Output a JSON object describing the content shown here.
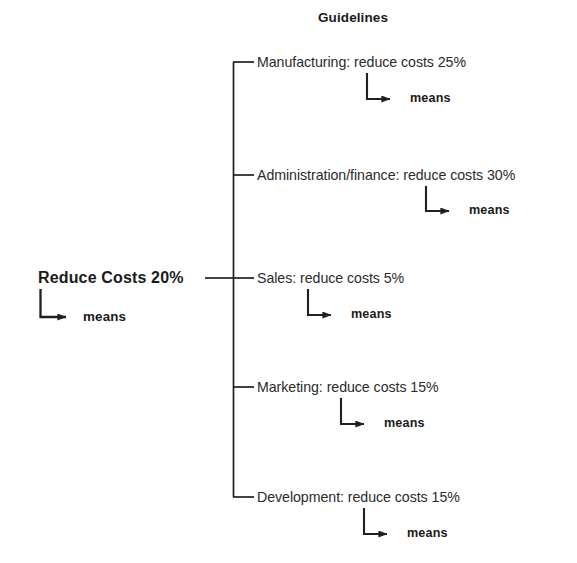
{
  "diagram": {
    "type": "tree",
    "title": "Guidelines",
    "root": {
      "label": "Reduce Costs 20%",
      "means_label": "means"
    },
    "branches": [
      {
        "label": "Manufacturing: reduce costs 25%",
        "means_label": "means",
        "department": "Manufacturing",
        "reduction_percent": 25
      },
      {
        "label": "Administration/finance: reduce costs 30%",
        "means_label": "means",
        "department": "Administration/finance",
        "reduction_percent": 30
      },
      {
        "label": "Sales: reduce costs 5%",
        "means_label": "means",
        "department": "Sales",
        "reduction_percent": 5
      },
      {
        "label": "Marketing: reduce costs 15%",
        "means_label": "means",
        "department": "Marketing",
        "reduction_percent": 15
      },
      {
        "label": "Development: reduce costs 15%",
        "means_label": "means",
        "department": "Development",
        "reduction_percent": 15
      }
    ],
    "colors": {
      "line": "#231f20",
      "text": "#2b2b2b",
      "bold_text": "#1a1a1a",
      "background": "#ffffff"
    }
  }
}
